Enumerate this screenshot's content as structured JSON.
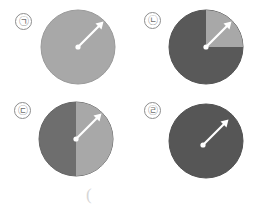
{
  "figure": {
    "background_color": "#ffffff",
    "bottom_marker": "(",
    "bottom_marker_color": "#d6d6d6",
    "arrow_color": "#ffffff",
    "outline_color": "#9a9a9a"
  },
  "panels": [
    {
      "label": "㉠",
      "label_plain": "ㄱ",
      "name": "panel-a",
      "fill_description": "uniform medium gray disc",
      "base_color": "#a8a8a8",
      "highlight_color": "#a8a8a8",
      "highlight_region": "none",
      "arrow": {
        "origin_x": 39,
        "origin_y": 44,
        "tip_x": 62,
        "tip_y": 21,
        "angle_deg": 45,
        "color": "#ffffff"
      }
    },
    {
      "label": "㉡",
      "label_plain": "ㄴ",
      "name": "panel-b",
      "fill_description": "dark gray disc with lighter upper-right quadrant",
      "base_color": "#595959",
      "highlight_color": "#a8a8a8",
      "highlight_region": "quadrant-0-to-90",
      "arrow": {
        "origin_x": 39,
        "origin_y": 40,
        "tip_x": 62,
        "tip_y": 17,
        "angle_deg": 45,
        "color": "#ffffff"
      }
    },
    {
      "label": "㉢",
      "label_plain": "ㄷ",
      "name": "panel-c",
      "fill_description": "disc split vertically, dark left half and lighter right half",
      "base_color": "#6e6e6e",
      "highlight_color": "#a8a8a8",
      "highlight_region": "right-half",
      "arrow": {
        "origin_x": 39,
        "origin_y": 41,
        "tip_x": 62,
        "tip_y": 18,
        "angle_deg": 45,
        "color": "#ffffff"
      }
    },
    {
      "label": "㉣",
      "label_plain": "ㄹ",
      "name": "panel-d",
      "fill_description": "uniform dark gray disc",
      "base_color": "#565656",
      "highlight_color": "#565656",
      "highlight_region": "none",
      "arrow": {
        "origin_x": 36,
        "origin_y": 45,
        "tip_x": 60,
        "tip_y": 20,
        "angle_deg": 45,
        "color": "#ffffff"
      }
    }
  ]
}
